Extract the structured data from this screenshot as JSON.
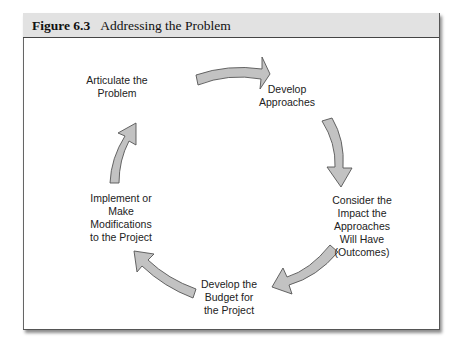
{
  "figure": {
    "number": "Figure 6.3",
    "title": "Addressing the Problem"
  },
  "colors": {
    "header_bg": "#e2e2e2",
    "arrow_fill": "#c2c2c2",
    "arrow_stroke": "#555555",
    "text": "#222222"
  },
  "cycle": {
    "nodes": [
      {
        "id": "articulate",
        "lines": [
          "Articulate the",
          "Problem"
        ]
      },
      {
        "id": "develop-approaches",
        "lines": [
          "Develop",
          "Approaches"
        ]
      },
      {
        "id": "consider-impact",
        "lines": [
          "Consider the",
          "Impact the",
          "Approaches",
          "Will Have",
          "(Outcomes)"
        ]
      },
      {
        "id": "develop-budget",
        "lines": [
          "Develop the",
          "Budget for",
          "the Project"
        ]
      },
      {
        "id": "implement",
        "lines": [
          "Implement or",
          "Make",
          "Modifications",
          "to the Project"
        ]
      }
    ],
    "arrows": [
      {
        "from": "articulate",
        "to": "develop-approaches"
      },
      {
        "from": "develop-approaches",
        "to": "consider-impact"
      },
      {
        "from": "consider-impact",
        "to": "develop-budget"
      },
      {
        "from": "develop-budget",
        "to": "implement"
      },
      {
        "from": "implement",
        "to": "articulate"
      }
    ]
  }
}
